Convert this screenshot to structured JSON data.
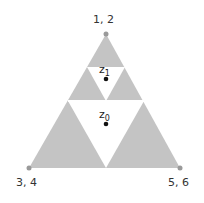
{
  "diagram": {
    "type": "sierpinski-triangle-level-2",
    "fill_color": "#c4c4c4",
    "vertices": [
      {
        "label": "1, 2",
        "x": 106,
        "y": 34
      },
      {
        "label": "3, 4",
        "x": 29,
        "y": 168
      },
      {
        "label": "5, 6",
        "x": 180,
        "y": 168
      }
    ],
    "points": [
      {
        "name": "z",
        "sub": "1",
        "x": 106,
        "y": 79
      },
      {
        "name": "z",
        "sub": "0",
        "x": 106,
        "y": 124
      }
    ]
  }
}
